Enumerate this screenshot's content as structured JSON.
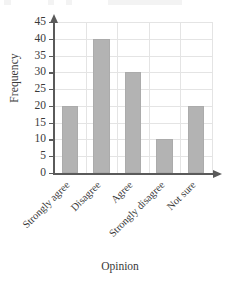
{
  "chart_data": {
    "type": "bar",
    "title": "",
    "xlabel": "Opinion",
    "ylabel": "Frequency",
    "categories": [
      "Strongly agree",
      "Disagree",
      "Agree",
      "Strongly disagree",
      "Not sure"
    ],
    "values": [
      20,
      40,
      30,
      10,
      20
    ],
    "ylim": [
      0,
      45
    ],
    "ytick_values": [
      0,
      5,
      10,
      15,
      20,
      25,
      30,
      35,
      40,
      45
    ],
    "ytick_labels": [
      "0",
      "5",
      "10",
      "15",
      "20",
      "25",
      "30",
      "35",
      "40",
      "45"
    ],
    "ytick_step": 5,
    "grid": true,
    "grid_axis": "both",
    "legend": false,
    "legend_position": "none",
    "bar_color": "#b3b3b3",
    "bar_edge_color": "#ababab",
    "grid_color": "#e4e4e4",
    "axis_color": "#5a5a5a",
    "text_color": "#3a3a3a",
    "background_color": "#ffffff",
    "xtick_label_rotation": -45,
    "axis_arrows": true
  }
}
